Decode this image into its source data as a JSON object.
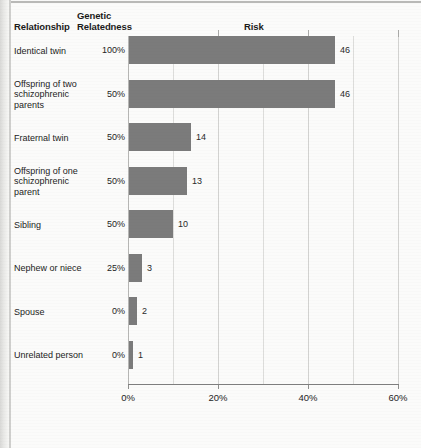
{
  "columns": {
    "relationship": "Relationship",
    "relatedness_line1": "Genetic",
    "relatedness_line2": "Relatedness",
    "risk": "Risk"
  },
  "chart_data": {
    "type": "bar",
    "orientation": "horizontal",
    "title": "",
    "xlabel": "Risk",
    "ylabel": "Relationship",
    "xlim": [
      0,
      60
    ],
    "xticks": [
      0,
      20,
      40,
      60
    ],
    "xtick_labels": [
      "0%",
      "20%",
      "40%",
      "60%"
    ],
    "minor_gridlines": [
      10,
      30,
      50
    ],
    "grid": true,
    "legend": "none",
    "bar_color": "#7b7b7b",
    "categories": [
      "Identical twin",
      "Offspring of two schizophrenic parents",
      "Fraternal twin",
      "Offspring of one schizophrenic parent",
      "Sibling",
      "Nephew or niece",
      "Spouse",
      "Unrelated person"
    ],
    "values": [
      46,
      46,
      14,
      13,
      10,
      3,
      2,
      1
    ],
    "value_labels": [
      "46",
      "46",
      "14",
      "13",
      "10",
      "3",
      "2",
      "1"
    ],
    "genetic_relatedness": [
      "100%",
      "50%",
      "50%",
      "50%",
      "50%",
      "25%",
      "0%",
      "0%"
    ]
  },
  "rows": [
    {
      "label_lines": [
        "Identical twin"
      ],
      "pct": "100%",
      "value": 46,
      "value_label": "46"
    },
    {
      "label_lines": [
        "Offspring of two",
        "schizophrenic",
        "parents"
      ],
      "pct": "50%",
      "value": 46,
      "value_label": "46"
    },
    {
      "label_lines": [
        "Fraternal twin"
      ],
      "pct": "50%",
      "value": 14,
      "value_label": "14"
    },
    {
      "label_lines": [
        "Offspring of one",
        "schizophrenic",
        "parent"
      ],
      "pct": "50%",
      "value": 13,
      "value_label": "13"
    },
    {
      "label_lines": [
        "Sibling"
      ],
      "pct": "50%",
      "value": 10,
      "value_label": "10"
    },
    {
      "label_lines": [
        "Nephew or niece"
      ],
      "pct": "25%",
      "value": 3,
      "value_label": "3"
    },
    {
      "label_lines": [
        "Spouse"
      ],
      "pct": "0%",
      "value": 2,
      "value_label": "2"
    },
    {
      "label_lines": [
        "Unrelated person"
      ],
      "pct": "0%",
      "value": 1,
      "value_label": "1"
    }
  ],
  "axis": {
    "labels": [
      "0%",
      "20%",
      "40%",
      "60%"
    ],
    "values": [
      0,
      20,
      40,
      60
    ]
  }
}
